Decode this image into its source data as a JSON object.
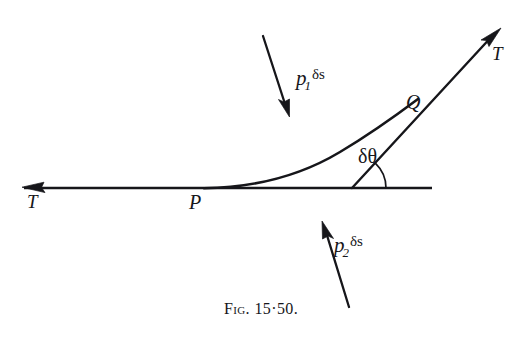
{
  "figure": {
    "caption_prefix": "Fig.",
    "caption_number": "15·50.",
    "caption_full": "Fig. 15·50.",
    "background_color": "#ffffff",
    "ink_color": "#16161a"
  },
  "labels": {
    "tension_left": "T",
    "tension_right": "T",
    "point_p": "P",
    "point_q": "Q",
    "angle": "δθ",
    "force_upper": {
      "symbol": "p",
      "subscript": "1",
      "element": "δs",
      "full": "p₁ δs"
    },
    "force_lower": {
      "symbol": "p",
      "subscript": "2",
      "element": "δs",
      "full": "p₂ δs"
    }
  },
  "geometry": {
    "baseline": {
      "x1": 22,
      "y1": 188,
      "x2": 432,
      "y2": 188
    },
    "left_arrow_tip": {
      "x": 22,
      "y": 187
    },
    "point_p": {
      "x": 205,
      "y": 188
    },
    "point_q": {
      "x": 415,
      "y": 105
    },
    "chord_foot": {
      "x": 352,
      "y": 188
    },
    "tangent_arrow_tip": {
      "x": 501,
      "y": 28
    },
    "curve_path": "M 205 188 C 268 187 318 165 360 133 C 390 110 404 100 416 92",
    "chord_path": "M 352 188 L 501 28",
    "angle_arc_radius": 34,
    "force_upper_arrow": {
      "x1": 263,
      "y1": 36,
      "x2": 289,
      "y2": 116
    },
    "force_lower_arrow": {
      "x1": 349,
      "y1": 307,
      "x2": 322,
      "y2": 221
    }
  }
}
